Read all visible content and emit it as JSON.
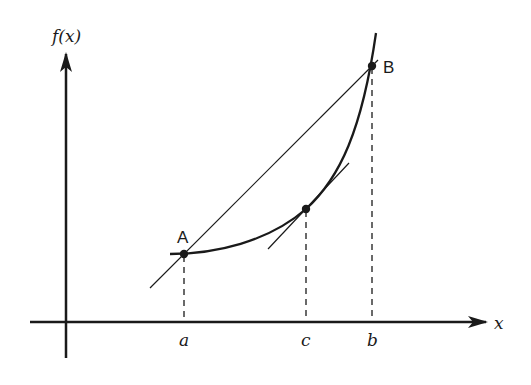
{
  "diagram": {
    "type": "mean-value-theorem",
    "colors": {
      "ink": "#1a1a1a",
      "background": "#ffffff"
    },
    "axes": {
      "y_label": "f(x)",
      "x_label": "x"
    },
    "points": [
      {
        "id": "A",
        "label": "A"
      },
      {
        "id": "B",
        "label": "B"
      },
      {
        "id": "C",
        "label": ""
      }
    ],
    "ticks": [
      {
        "label": "a"
      },
      {
        "label": "c"
      },
      {
        "label": "b"
      }
    ],
    "elements": [
      "curve f(x) from A to B",
      "secant line through A and B",
      "tangent line at c parallel to secant",
      "dashed drop lines from A, C, B to x-axis"
    ]
  }
}
